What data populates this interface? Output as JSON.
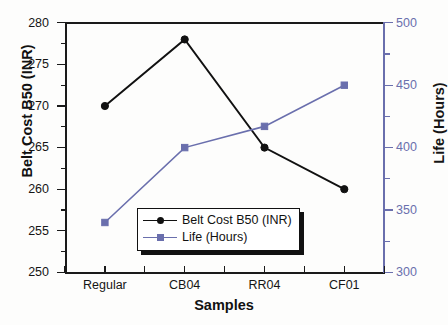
{
  "chart_data": {
    "type": "line",
    "title": "",
    "xlabel": "Samples",
    "ylabel": "Belt Cost B50 (INR)",
    "y2label": "Life (Hours)",
    "categories": [
      "Regular",
      "CB04",
      "RR04",
      "CF01"
    ],
    "ylim": [
      250,
      280
    ],
    "y2lim": [
      300,
      500
    ],
    "yticks": [
      250,
      255,
      260,
      265,
      270,
      275,
      280
    ],
    "y2ticks": [
      300,
      350,
      400,
      450,
      500
    ],
    "grid": false,
    "legend_position": "center-bottom-inside",
    "series": [
      {
        "name": "Belt Cost B50 (INR)",
        "axis": "left",
        "color": "#111111",
        "marker": "circle",
        "values": [
          270,
          278,
          265,
          260
        ]
      },
      {
        "name": "Life (Hours)",
        "axis": "right",
        "color": "#6a6fad",
        "marker": "square",
        "values": [
          340,
          400,
          417,
          450
        ]
      }
    ]
  },
  "axes": {
    "left": {
      "title": "Belt Cost B50 (INR)",
      "tick_labels": [
        "250",
        "255",
        "260",
        "265",
        "270",
        "275",
        "280"
      ],
      "color": "#111111"
    },
    "right": {
      "title": "Life (Hours)",
      "tick_labels": [
        "300",
        "350",
        "400",
        "450",
        "500"
      ],
      "color": "#6a6fad"
    },
    "bottom": {
      "title": "Samples",
      "tick_labels": [
        "Regular",
        "CB04",
        "RR04",
        "CF01"
      ]
    }
  },
  "legend": {
    "entries": [
      {
        "label": "Belt Cost B50 (INR)",
        "color": "#111111",
        "marker": "circle"
      },
      {
        "label": "Life (Hours)",
        "color": "#6a6fad",
        "marker": "square"
      }
    ]
  }
}
